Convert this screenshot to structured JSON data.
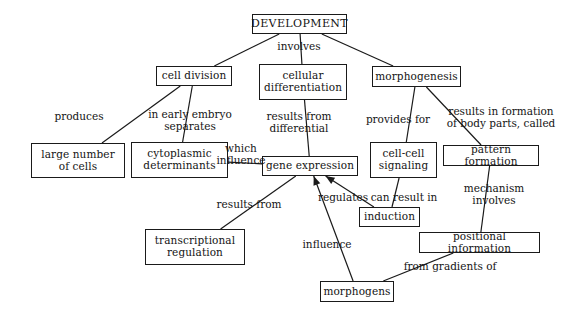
{
  "diagram": {
    "type": "concept-map",
    "background_color": "#ffffff",
    "line_color": "#1a1a1a",
    "text_color": "#141414",
    "nodes": [
      {
        "id": "development",
        "label": "DEVELOPMENT",
        "x": 252,
        "y": 14,
        "w": 95,
        "h": 20
      },
      {
        "id": "cell-division",
        "label": "cell division",
        "x": 156,
        "y": 66,
        "w": 76,
        "h": 20
      },
      {
        "id": "cellular-differentiation",
        "label": "cellular\ndifferentiation",
        "x": 259,
        "y": 64,
        "w": 88,
        "h": 36
      },
      {
        "id": "morphogenesis",
        "label": "morphogenesis",
        "x": 372,
        "y": 66,
        "w": 89,
        "h": 21
      },
      {
        "id": "large-number-of-cells",
        "label": "large number\nof cells",
        "x": 31,
        "y": 143,
        "w": 94,
        "h": 35
      },
      {
        "id": "cytoplasmic-determinants",
        "label": "cytoplasmic\ndeterminants",
        "x": 131,
        "y": 142,
        "w": 97,
        "h": 36
      },
      {
        "id": "gene-expression",
        "label": "gene expression",
        "x": 262,
        "y": 156,
        "w": 96,
        "h": 20
      },
      {
        "id": "cell-cell-signaling",
        "label": "cell-cell\nsignaling",
        "x": 370,
        "y": 142,
        "w": 67,
        "h": 36
      },
      {
        "id": "pattern-formation",
        "label": "pattern formation",
        "x": 443,
        "y": 145,
        "w": 96,
        "h": 21
      },
      {
        "id": "induction",
        "label": "induction",
        "x": 359,
        "y": 207,
        "w": 61,
        "h": 20
      },
      {
        "id": "transcriptional-regulation",
        "label": "transcriptional\nregulation",
        "x": 145,
        "y": 229,
        "w": 100,
        "h": 36
      },
      {
        "id": "positional-information",
        "label": "positional information",
        "x": 419,
        "y": 232,
        "w": 121,
        "h": 21
      },
      {
        "id": "morphogens",
        "label": "morphogens",
        "x": 320,
        "y": 281,
        "w": 74,
        "h": 21
      }
    ],
    "link_labels": [
      {
        "id": "involves-top",
        "text": "involves",
        "x": 266,
        "y": 40,
        "w": 66
      },
      {
        "id": "produces",
        "text": "produces",
        "x": 48,
        "y": 110,
        "w": 62
      },
      {
        "id": "in-early-embryo-separates",
        "text": "in early embryo\nseparates",
        "x": 141,
        "y": 108,
        "w": 98
      },
      {
        "id": "results-from-differential",
        "text": "results from\ndifferential",
        "x": 258,
        "y": 110,
        "w": 82
      },
      {
        "id": "which-influence",
        "text": "which\ninfluence",
        "x": 216,
        "y": 142,
        "w": 50
      },
      {
        "id": "provides-for",
        "text": "provides for",
        "x": 360,
        "y": 113,
        "w": 76
      },
      {
        "id": "results-in-formation-of-body-parts-called",
        "text": "results in formation\nof body parts, called",
        "x": 439,
        "y": 105,
        "w": 124
      },
      {
        "id": "regulates",
        "text": "regulates",
        "x": 312,
        "y": 191,
        "w": 62
      },
      {
        "id": "can-result-in",
        "text": "can result in",
        "x": 366,
        "y": 191,
        "w": 76
      },
      {
        "id": "mechanism-involves",
        "text": "mechanism\ninvolves",
        "x": 456,
        "y": 182,
        "w": 76
      },
      {
        "id": "results-from",
        "text": "results from",
        "x": 212,
        "y": 198,
        "w": 74
      },
      {
        "id": "influence",
        "text": "influence",
        "x": 296,
        "y": 238,
        "w": 62
      },
      {
        "id": "from-gradients-of",
        "text": "from gradients of",
        "x": 398,
        "y": 260,
        "w": 104
      }
    ],
    "edges": [
      {
        "id": "development-to-cell-division",
        "from": "development",
        "to": "cell-division",
        "arrow": false
      },
      {
        "id": "development-to-cellular-differentiation",
        "from": "development",
        "to": "cellular-differentiation",
        "arrow": false
      },
      {
        "id": "development-to-morphogenesis",
        "from": "development",
        "to": "morphogenesis",
        "arrow": false
      },
      {
        "id": "cell-division-to-large-number-of-cells",
        "from": "cell-division",
        "to": "large-number-of-cells",
        "arrow": false
      },
      {
        "id": "cell-division-to-cytoplasmic-determinants",
        "from": "cell-division",
        "to": "cytoplasmic-determinants",
        "arrow": false
      },
      {
        "id": "cytoplasmic-determinants-to-gene-expression",
        "from": "cytoplasmic-determinants",
        "to": "gene-expression",
        "arrow": false
      },
      {
        "id": "cellular-differentiation-to-gene-expression",
        "from": "cellular-differentiation",
        "to": "gene-expression",
        "arrow": false
      },
      {
        "id": "morphogenesis-to-cell-cell-signaling",
        "from": "morphogenesis",
        "to": "cell-cell-signaling",
        "arrow": false
      },
      {
        "id": "morphogenesis-to-pattern-formation",
        "from": "morphogenesis",
        "to": "pattern-formation",
        "arrow": false
      },
      {
        "id": "cell-cell-signaling-to-induction",
        "from": "cell-cell-signaling",
        "to": "induction",
        "arrow": false
      },
      {
        "id": "induction-to-gene-expression",
        "from": "induction",
        "to": "gene-expression",
        "arrow": true
      },
      {
        "id": "pattern-formation-to-positional-information",
        "from": "pattern-formation",
        "to": "positional-information",
        "arrow": false
      },
      {
        "id": "positional-information-to-morphogens",
        "from": "positional-information",
        "to": "morphogens",
        "arrow": false
      },
      {
        "id": "morphogens-to-gene-expression",
        "from": "morphogens",
        "to": "gene-expression",
        "arrow": true
      },
      {
        "id": "gene-expression-to-transcriptional-regulation",
        "from": "gene-expression",
        "to": "transcriptional-regulation",
        "arrow": false
      }
    ]
  }
}
